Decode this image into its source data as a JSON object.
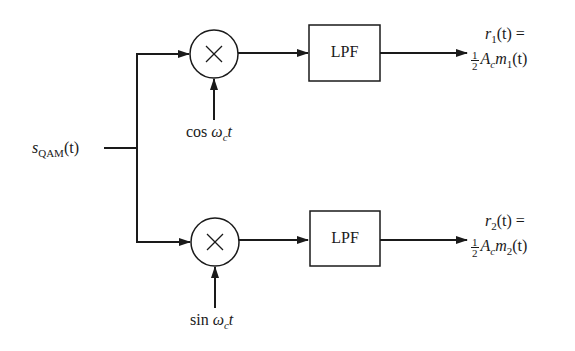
{
  "diagram": {
    "type": "QAM coherent demodulator block diagram",
    "input": {
      "symbol": "s",
      "subscript": "QAM",
      "arg": "(t)"
    },
    "branches": [
      {
        "id": "upper",
        "multiplier_symbol": "×",
        "carrier": {
          "fn": "cos",
          "omega": "ω",
          "omega_sub": "c",
          "var": "t"
        },
        "filter_label": "LPF",
        "output": {
          "lhs_symbol": "r",
          "lhs_sub": "1",
          "lhs_arg": "(t) =",
          "frac_num": "1",
          "frac_den": "2",
          "amp": "A",
          "amp_sub": "c",
          "msg": "m",
          "msg_sub": "1",
          "msg_arg": "(t)"
        }
      },
      {
        "id": "lower",
        "multiplier_symbol": "×",
        "carrier": {
          "fn": "sin",
          "omega": "ω",
          "omega_sub": "c",
          "var": "t"
        },
        "filter_label": "LPF",
        "output": {
          "lhs_symbol": "r",
          "lhs_sub": "2",
          "lhs_arg": "(t) =",
          "frac_num": "1",
          "frac_den": "2",
          "amp": "A",
          "amp_sub": "c",
          "msg": "m",
          "msg_sub": "2",
          "msg_arg": "(t)"
        }
      }
    ],
    "colors": {
      "stroke": "#1a1a1a",
      "background": "#ffffff"
    }
  }
}
